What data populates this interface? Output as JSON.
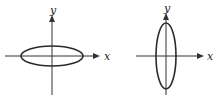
{
  "figures": [
    {
      "name": "horizontal-ellipse",
      "x_label": "x",
      "y_label": "y",
      "ellipse": {
        "cx": 52,
        "cy": 56,
        "rx": 31,
        "ry": 10
      },
      "x_axis": {
        "x1": 5,
        "x2": 98,
        "y": 56
      },
      "y_axis": {
        "x": 52,
        "y1": 17,
        "y2": 95
      }
    },
    {
      "name": "vertical-ellipse",
      "x_label": "x",
      "y_label": "y",
      "ellipse": {
        "cx": 166,
        "cy": 56,
        "rx": 10,
        "ry": 33
      },
      "x_axis": {
        "x1": 136,
        "x2": 202,
        "y": 56
      },
      "y_axis": {
        "x": 166,
        "y1": 14,
        "y2": 95
      }
    }
  ],
  "colors": {
    "stroke": "#2a2a2a",
    "background": "#ffffff"
  }
}
